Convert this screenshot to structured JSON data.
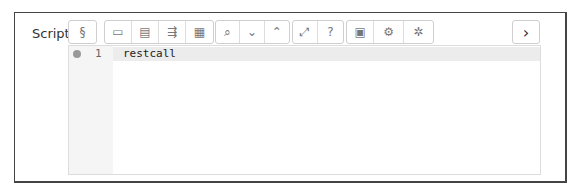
{
  "field": {
    "label": "Script"
  },
  "toolbar": {
    "groups": [
      [
        {
          "name": "snippet",
          "glyph": "§"
        }
      ],
      [
        {
          "name": "comment",
          "glyph": "▭"
        },
        {
          "name": "indent",
          "glyph": "▤"
        },
        {
          "name": "fold",
          "glyph": "⇶"
        },
        {
          "name": "unfold",
          "glyph": "▦"
        }
      ],
      [
        {
          "name": "search",
          "glyph": "⌕"
        },
        {
          "name": "next",
          "glyph": "⌄"
        },
        {
          "name": "previous",
          "glyph": "⌃"
        }
      ],
      [
        {
          "name": "fullscreen",
          "glyph": "⤢"
        },
        {
          "name": "help",
          "glyph": "?"
        }
      ],
      [
        {
          "name": "save",
          "glyph": "▣"
        },
        {
          "name": "run",
          "glyph": "⚙"
        },
        {
          "name": "debug",
          "glyph": "✲"
        }
      ]
    ],
    "expand_glyph": "›"
  },
  "editor": {
    "lines": [
      {
        "number": "1",
        "text": "restcall"
      }
    ]
  }
}
